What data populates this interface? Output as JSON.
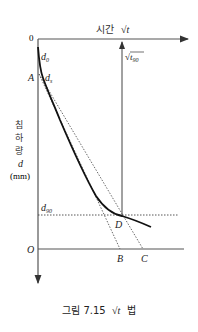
{
  "diagram": {
    "title": "시간 √t",
    "x_axis_label": "시간",
    "x_axis_symbol": "√t",
    "origin_top_label": "0",
    "origin_bottom_label": "O",
    "y_axis_label_chars": [
      "침",
      "하",
      "량"
    ],
    "y_axis_symbol": "d",
    "y_axis_unit": "(mm)",
    "points": {
      "d0": "d",
      "d0_sub": "0",
      "ds": "d",
      "ds_sub": "s",
      "A": "A",
      "B": "B",
      "C": "C",
      "D": "D",
      "d90": "d",
      "d90_sub": "90",
      "sqrt_t90": "t",
      "sqrt_t90_sub": "90"
    },
    "colors": {
      "line": "#222222",
      "axis": "#555555",
      "dotted": "#444444"
    }
  },
  "caption": {
    "prefix": "그림 7.15",
    "symbol": "√t",
    "suffix": "법"
  }
}
